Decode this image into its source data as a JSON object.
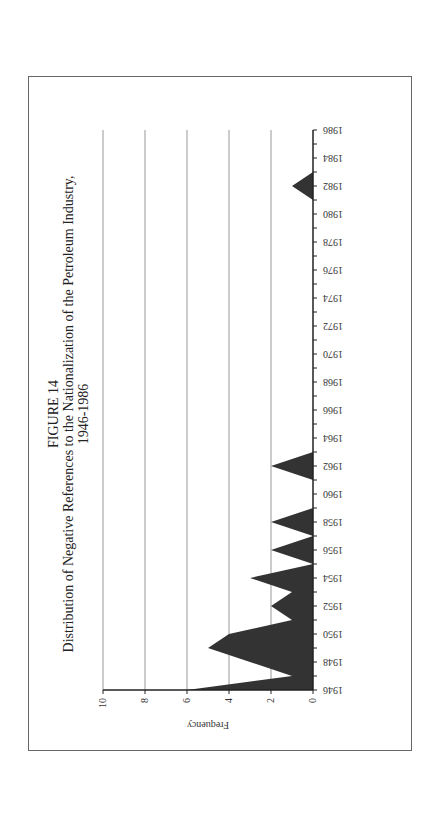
{
  "figure": {
    "number": "FIGURE 14",
    "title": "Distribution of Negative References to the Nationalization of the Petroleum Industry,",
    "subtitle": "1946-1986"
  },
  "chart_data": {
    "type": "area",
    "xlabel": "",
    "ylabel": "Frequency",
    "orientation": "rotated 90° counter-clockwise on page",
    "ylim": [
      0,
      10
    ],
    "yticks": [
      0,
      2,
      4,
      6,
      8,
      10
    ],
    "xticks": [
      1946,
      1948,
      1950,
      1952,
      1954,
      1956,
      1958,
      1960,
      1962,
      1964,
      1966,
      1968,
      1970,
      1972,
      1974,
      1976,
      1978,
      1980,
      1982,
      1984,
      1986
    ],
    "grid": "horizontal gridlines at 2,4,6,8,10",
    "fill_color": "#333333",
    "x": [
      1946,
      1947,
      1948,
      1949,
      1950,
      1951,
      1952,
      1953,
      1954,
      1955,
      1956,
      1957,
      1958,
      1959,
      1960,
      1961,
      1962,
      1963,
      1964,
      1965,
      1966,
      1967,
      1968,
      1969,
      1970,
      1971,
      1972,
      1973,
      1974,
      1975,
      1976,
      1977,
      1978,
      1979,
      1980,
      1981,
      1982,
      1983,
      1984,
      1985,
      1986
    ],
    "values": [
      6,
      1,
      3,
      5,
      4,
      1,
      2,
      1,
      3,
      0,
      2,
      0,
      2,
      0,
      0,
      0,
      2,
      0,
      0,
      0,
      0,
      0,
      0,
      0,
      0,
      0,
      0,
      0,
      0,
      0,
      0,
      0,
      0,
      0,
      0,
      0,
      1,
      0,
      0,
      0,
      0
    ]
  }
}
